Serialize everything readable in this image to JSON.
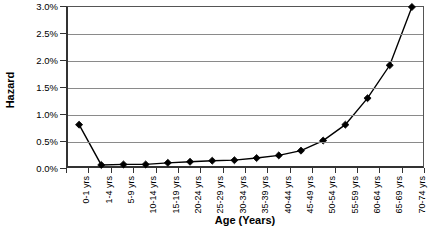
{
  "chart_data": {
    "type": "line",
    "title": "",
    "xlabel": "Age (Years)",
    "ylabel": "Hazard",
    "categories": [
      "0-1 yrs",
      "1-4 yrs",
      "5-9 yrs",
      "10-14 yrs",
      "15-19 yrs",
      "20-24 yrs",
      "25-29 yrs",
      "30-34 yrs",
      "35-39 yrs",
      "40-44 yrs",
      "45-49 yrs",
      "50-54 yrs",
      "55-59 yrs",
      "60-64 yrs",
      "65-69 yrs",
      "70-74 yrs"
    ],
    "values": [
      0.78,
      0.02,
      0.03,
      0.03,
      0.06,
      0.08,
      0.1,
      0.11,
      0.15,
      0.2,
      0.29,
      0.48,
      0.78,
      1.28,
      1.9,
      3.0
    ],
    "y_tick_labels": [
      "3.0%",
      "2.5%",
      "2.0%",
      "1.5%",
      "1.0%",
      "0.5%",
      "0.0%"
    ],
    "y_tick_values": [
      3.0,
      2.5,
      2.0,
      1.5,
      1.0,
      0.5,
      0.0
    ],
    "ylim": [
      0.0,
      3.0
    ],
    "y_unit": "%",
    "grid": true,
    "legend": false,
    "marker": "diamond",
    "series_color": "#000000",
    "gridline_color": "#8a8a8a",
    "axis_color": "#333333",
    "background_color": "#ffffff"
  }
}
